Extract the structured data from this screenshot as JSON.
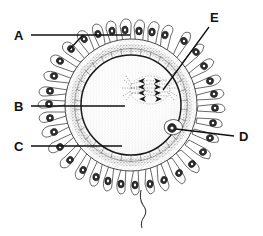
{
  "figure": {
    "kind": "biological line drawing",
    "background_color": "#ffffff",
    "ink_color": "#101010"
  },
  "labels": [
    {
      "id": "A",
      "text": "A",
      "x": 14,
      "y": 40,
      "target": "corona-radiata-cells"
    },
    {
      "id": "B",
      "text": "B",
      "x": 14,
      "y": 111,
      "target": "ooplasm-cytoplasm"
    },
    {
      "id": "C",
      "text": "C",
      "x": 14,
      "y": 151,
      "target": "zona-pellucida"
    },
    {
      "id": "D",
      "text": "D",
      "x": 239,
      "y": 141,
      "target": "polar-body"
    },
    {
      "id": "E",
      "text": "E",
      "x": 210,
      "y": 22,
      "target": "meiotic-spindle-chromosomes"
    }
  ],
  "structures": {
    "corona_radiata": {
      "name": "corona radiata",
      "cell_count": 30
    },
    "zona_pellucida": {
      "name": "zona pellucida",
      "outer_radius": 66,
      "inner_radius": 52
    },
    "oolemma": {
      "name": "cell membrane",
      "radius": 50
    },
    "ooplasm": {
      "name": "ooplasm"
    },
    "polar_body": {
      "name": "polar body",
      "x": 172,
      "y": 128
    },
    "spindle": {
      "name": "meiotic spindle",
      "x": 152,
      "y": 88,
      "chromosome_count": 8
    },
    "flagellum": {
      "name": "sperm tail"
    }
  },
  "colors": {
    "outline": "#3a3a3a",
    "membrane": "#1b1b1b",
    "nucleus": "#2e2e2e",
    "stipple": "#9a9a9a"
  }
}
